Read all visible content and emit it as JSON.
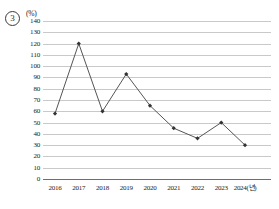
{
  "item_marker": "3",
  "unit_label": "(%)",
  "chart_data": {
    "type": "line",
    "title": "",
    "subtitle": "",
    "xlabel": "",
    "ylabel": "(%)",
    "unit": "%",
    "categories": [
      "2016",
      "2017",
      "2018",
      "2019",
      "2020",
      "2021",
      "2022",
      "2023",
      "2024(년)"
    ],
    "x": [
      2016,
      2017,
      2018,
      2019,
      2020,
      2021,
      2022,
      2023,
      2024
    ],
    "values": [
      58,
      120,
      60,
      93,
      65,
      45,
      36,
      50,
      30
    ],
    "series": [
      {
        "name": "",
        "values": [
          58,
          120,
          60,
          93,
          65,
          45,
          36,
          50,
          30
        ]
      }
    ],
    "ylim": [
      0,
      140
    ],
    "ytick_step": 10,
    "yticks": [
      0,
      10,
      20,
      30,
      40,
      50,
      60,
      70,
      80,
      90,
      100,
      110,
      120,
      130,
      140
    ],
    "ytick_labels": [
      "0",
      "10",
      "20",
      "30",
      "40",
      "50",
      "60",
      "70",
      "80",
      "90",
      "100",
      "110",
      "120",
      "130",
      "140"
    ],
    "grid": true,
    "grid_axis": "y",
    "legend": false,
    "legend_position": "none",
    "marker": "diamond",
    "line_color": "#555555",
    "marker_color": "#333333",
    "grid_color": "#c9c9c9",
    "axis_color": "#6e6e6e",
    "annotations": []
  }
}
